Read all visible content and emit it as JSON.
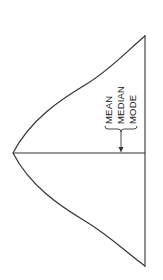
{
  "diagram": {
    "orientation": "rotated-90",
    "labels": {
      "mean": "MEAN",
      "median": "MEDIAN",
      "mode": "MODE"
    },
    "colors": {
      "line": "#333333",
      "background": "#ffffff"
    }
  }
}
